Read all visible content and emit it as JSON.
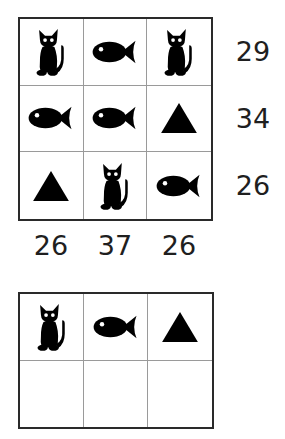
{
  "puzzle": {
    "type": "symbol-sum-grid",
    "symbols": {
      "C": "cat-icon",
      "F": "fish-icon",
      "T": "triangle-icon"
    },
    "grid": [
      [
        "C",
        "F",
        "C"
      ],
      [
        "F",
        "F",
        "T"
      ],
      [
        "T",
        "C",
        "F"
      ]
    ],
    "row_sums": [
      "29",
      "34",
      "26"
    ],
    "col_sums": [
      "26",
      "37",
      "26"
    ],
    "answer_grid": {
      "symbols": [
        "C",
        "F",
        "T"
      ],
      "values": [
        "",
        "",
        ""
      ]
    }
  },
  "colors": {
    "ink": "#000000",
    "grid_border": "#2a2a2a",
    "grid_inner": "#9a9a9a",
    "background": "#ffffff"
  }
}
